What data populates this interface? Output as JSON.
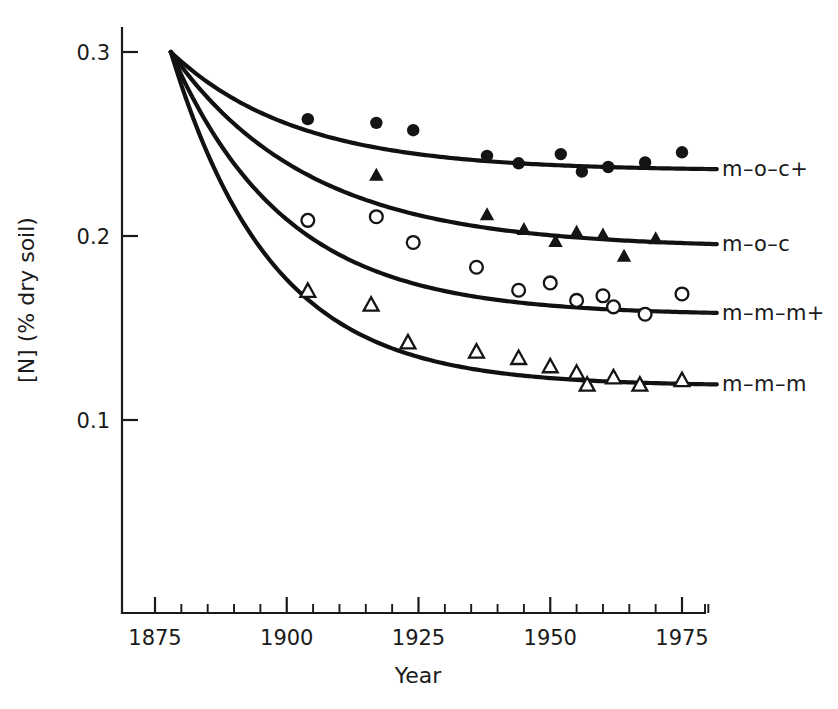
{
  "chart_data": {
    "type": "line",
    "title": "",
    "subtitle": "",
    "xlabel": "Year",
    "ylabel": "[N] (% dry soil)",
    "xlim": [
      1875,
      1985
    ],
    "ylim": [
      0.06,
      0.315
    ],
    "grid": false,
    "legend_position": "right-inline",
    "x_ticks_major": [
      1875,
      1900,
      1925,
      1950,
      1975
    ],
    "x_tick_labels": [
      "1875",
      "1900",
      "1925",
      "1950",
      "1975"
    ],
    "x_ticks_minor": [
      1880,
      1885,
      1890,
      1895,
      1905,
      1910,
      1915,
      1920,
      1930,
      1935,
      1940,
      1945,
      1955,
      1960,
      1965,
      1970,
      1980
    ],
    "y_ticks_major": [
      0.3,
      0.2,
      0.1
    ],
    "y_tick_labels": [
      "0.3",
      "0.2",
      "0.1"
    ],
    "series": [
      {
        "name": "m-o-c+",
        "label": "m–o–c+",
        "marker": "filled-circle",
        "start_year": 1878,
        "start_value": 0.3,
        "asymptote": 0.2355,
        "decay_rate": 0.042,
        "points": [
          {
            "x": 1904,
            "y": 0.2635
          },
          {
            "x": 1917,
            "y": 0.2615
          },
          {
            "x": 1924,
            "y": 0.2575
          },
          {
            "x": 1938,
            "y": 0.2435
          },
          {
            "x": 1944,
            "y": 0.2395
          },
          {
            "x": 1952,
            "y": 0.2445
          },
          {
            "x": 1956,
            "y": 0.235
          },
          {
            "x": 1961,
            "y": 0.2375
          },
          {
            "x": 1968,
            "y": 0.24
          },
          {
            "x": 1975,
            "y": 0.2455
          }
        ]
      },
      {
        "name": "m-o-c",
        "label": "m–o–c",
        "marker": "filled-triangle",
        "start_year": 1878,
        "start_value": 0.3,
        "asymptote": 0.1935,
        "decay_rate": 0.038,
        "points": [
          {
            "x": 1917,
            "y": 0.233
          },
          {
            "x": 1938,
            "y": 0.2115
          },
          {
            "x": 1945,
            "y": 0.2035
          },
          {
            "x": 1951,
            "y": 0.197
          },
          {
            "x": 1955,
            "y": 0.202
          },
          {
            "x": 1960,
            "y": 0.2005
          },
          {
            "x": 1964,
            "y": 0.189
          },
          {
            "x": 1970,
            "y": 0.1985
          }
        ]
      },
      {
        "name": "m-m-m+",
        "label": "m–m–m+",
        "marker": "open-circle",
        "start_year": 1878,
        "start_value": 0.3,
        "asymptote": 0.157,
        "decay_rate": 0.046,
        "points": [
          {
            "x": 1904,
            "y": 0.2085
          },
          {
            "x": 1917,
            "y": 0.2105
          },
          {
            "x": 1924,
            "y": 0.1965
          },
          {
            "x": 1936,
            "y": 0.183
          },
          {
            "x": 1944,
            "y": 0.1705
          },
          {
            "x": 1950,
            "y": 0.1745
          },
          {
            "x": 1955,
            "y": 0.165
          },
          {
            "x": 1960,
            "y": 0.1675
          },
          {
            "x": 1962,
            "y": 0.1615
          },
          {
            "x": 1968,
            "y": 0.1575
          },
          {
            "x": 1975,
            "y": 0.1685
          }
        ]
      },
      {
        "name": "m-m-m",
        "label": "m–m–m",
        "marker": "open-triangle",
        "start_year": 1878,
        "start_value": 0.3,
        "asymptote": 0.1185,
        "decay_rate": 0.052,
        "points": [
          {
            "x": 1904,
            "y": 0.17
          },
          {
            "x": 1916,
            "y": 0.1625
          },
          {
            "x": 1923,
            "y": 0.142
          },
          {
            "x": 1936,
            "y": 0.137
          },
          {
            "x": 1944,
            "y": 0.1335
          },
          {
            "x": 1950,
            "y": 0.129
          },
          {
            "x": 1955,
            "y": 0.1255
          },
          {
            "x": 1957,
            "y": 0.119
          },
          {
            "x": 1962,
            "y": 0.123
          },
          {
            "x": 1967,
            "y": 0.119
          },
          {
            "x": 1975,
            "y": 0.1215
          }
        ]
      }
    ]
  },
  "axes": {
    "y_title": "[N] (% dry soil)",
    "x_title": "Year"
  }
}
